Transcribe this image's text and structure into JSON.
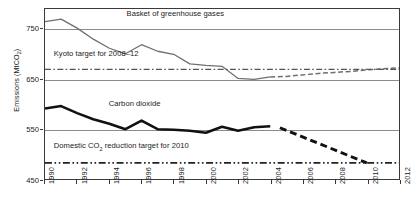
{
  "chart_data": {
    "type": "line",
    "title": "",
    "xlabel": "",
    "ylabel": "Emissions (MtCO",
    "ylabel_sub": "2",
    "ylabel_tail": ")",
    "xlim": [
      1990,
      2012
    ],
    "ylim": [
      450,
      790
    ],
    "yticks": [
      450,
      550,
      650,
      750
    ],
    "xticks": [
      1990,
      1992,
      1994,
      1996,
      1998,
      2000,
      2002,
      2004,
      2006,
      2008,
      2010,
      2012
    ],
    "grid": true,
    "legend": "none",
    "annotations": [
      {
        "text": "Basket of greenhouse gases",
        "x": 1995.1,
        "y": 778
      },
      {
        "text": "Kyoto target for 2008–12",
        "x": 1990.6,
        "y": 700
      },
      {
        "text": "Carbon dioxide",
        "x": 1994.0,
        "y": 600
      },
      {
        "text": "Domestic CO",
        "sub": "2",
        "text_tail": " reduction target for 2010",
        "x": 1990.6,
        "y": 517
      }
    ],
    "series": [
      {
        "name": "Basket of greenhouse gases",
        "style": "solid",
        "color": "#6f6f6f",
        "x": [
          1990,
          1991,
          1992,
          1993,
          1994,
          1995,
          1996,
          1997,
          1998,
          1999,
          2000,
          2001,
          2002,
          2003,
          2004
        ],
        "values": [
          765,
          770,
          752,
          730,
          712,
          701,
          719,
          706,
          700,
          681,
          678,
          676,
          652,
          650,
          655
        ]
      },
      {
        "name": "Basket of greenhouse gases (projection)",
        "style": "dashed",
        "color": "#6f6f6f",
        "x": [
          2004,
          2005,
          2006,
          2007,
          2008,
          2009,
          2010,
          2011,
          2012
        ],
        "values": [
          655,
          656,
          659,
          662,
          664,
          666,
          669,
          671,
          673
        ]
      },
      {
        "name": "Kyoto target for 2008-12",
        "style": "dash-dot",
        "color": "#555555",
        "x": [
          1990,
          2012
        ],
        "values": [
          670,
          670
        ]
      },
      {
        "name": "Carbon dioxide",
        "style": "solid-thick",
        "color": "#111111",
        "x": [
          1990,
          1991,
          1992,
          1993,
          1994,
          1995,
          1996,
          1997,
          1998,
          1999,
          2000,
          2001,
          2002,
          2003,
          2004
        ],
        "values": [
          592,
          597,
          583,
          571,
          562,
          551,
          568,
          551,
          550,
          548,
          544,
          556,
          548,
          555,
          557
        ]
      },
      {
        "name": "Carbon dioxide (projection)",
        "style": "dashed-thick",
        "color": "#111111",
        "x": [
          2004.6,
          2010
        ],
        "values": [
          554,
          484
        ]
      },
      {
        "name": "Domestic CO2 reduction target for 2010",
        "style": "dash-dot-dot",
        "color": "#222222",
        "x": [
          1990,
          2012
        ],
        "values": [
          484,
          484
        ]
      }
    ]
  }
}
